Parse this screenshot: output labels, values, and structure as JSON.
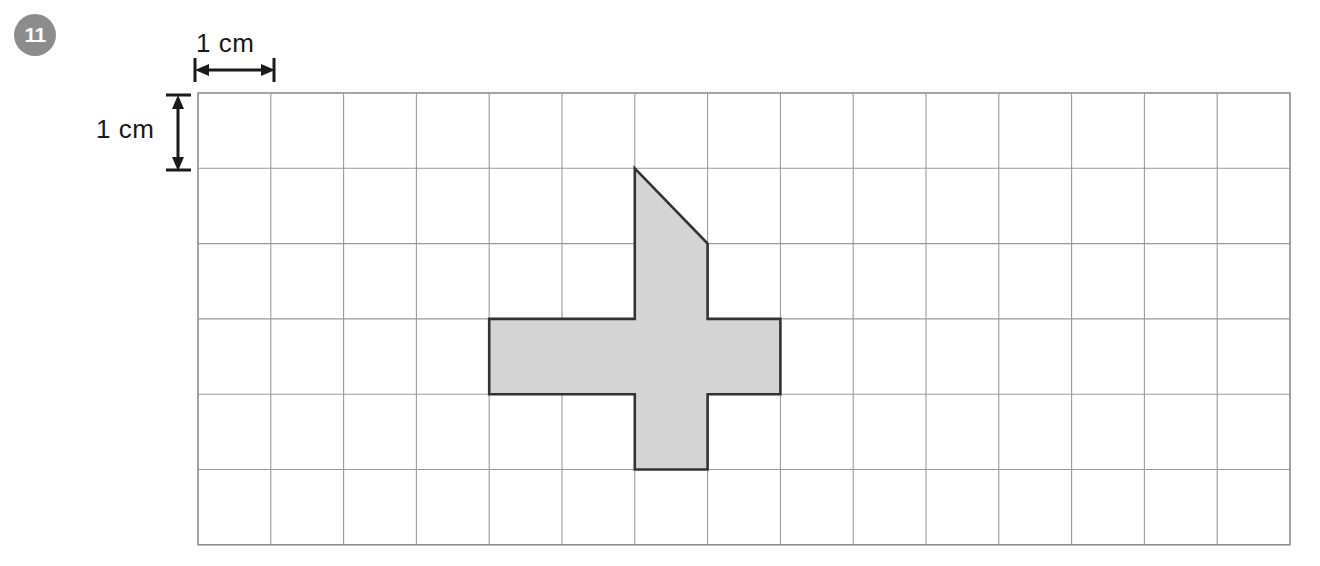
{
  "question": {
    "number": "11"
  },
  "dimensions": {
    "horizontal_label": "1 cm",
    "vertical_label": "1 cm"
  },
  "grid": {
    "columns": 15,
    "rows": 6,
    "origin_x": 198,
    "origin_y": 93,
    "cell_width": 72.8,
    "cell_height": 75.3,
    "line_color": "#9a9a9a",
    "border_color": "#8e8e8e"
  },
  "shape": {
    "name": "shaded-compound-figure",
    "fill_color": "#d4d4d4",
    "stroke_color": "#333333",
    "description": "Plus-sign cross with a right-triangle roof on the upper stem",
    "vertices_grid": [
      [
        6,
        1
      ],
      [
        7,
        2
      ],
      [
        7,
        3
      ],
      [
        8,
        3
      ],
      [
        8,
        4
      ],
      [
        7,
        4
      ],
      [
        7,
        5
      ],
      [
        6,
        5
      ],
      [
        6,
        4
      ],
      [
        4,
        4
      ],
      [
        4,
        3
      ],
      [
        6,
        3
      ]
    ]
  },
  "colors": {
    "badge_background": "#8c8c8c",
    "badge_text": "#ffffff",
    "page_background": "#ffffff",
    "ink": "#1a1a1a"
  },
  "chart_data": {
    "type": "table",
    "xlabel": "",
    "ylabel": "",
    "categories": [
      "grid columns",
      "grid rows",
      "cell size (cm)",
      "full squares shaded",
      "half squares shaded",
      "total area (sq cm)"
    ],
    "values": [
      15,
      6,
      1,
      5,
      1,
      5.5
    ],
    "annotations": [
      "1 cm",
      "1 cm",
      "11"
    ]
  }
}
